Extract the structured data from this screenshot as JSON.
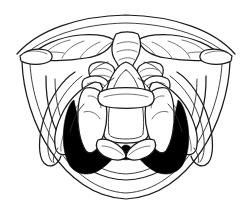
{
  "figure": {
    "kind": "line-drawing",
    "caption": "",
    "background_color": "#ffffff",
    "line_color": "#1a1a1a",
    "shadow_color": "#000000",
    "width": 251,
    "height": 224
  },
  "structures": {
    "tongue_base": {
      "label": "Base of tongue",
      "region": "superior arc"
    },
    "vallecula_left": {
      "label": "Left vallecula",
      "region": "upper left"
    },
    "vallecula_right": {
      "label": "Right vallecula",
      "region": "upper right"
    },
    "median_glossoepiglottic_fold": {
      "label": "Median glossoepiglottic fold",
      "region": "upper center"
    },
    "epiglottis": {
      "label": "Epiglottis",
      "region": "center"
    },
    "aryepiglottic_fold_left": {
      "label": "Left aryepiglottic fold",
      "region": "center left"
    },
    "aryepiglottic_fold_right": {
      "label": "Right aryepiglottic fold",
      "region": "center right"
    },
    "vestibular_fold_left": {
      "label": "Left vestibular fold",
      "region": "mid left"
    },
    "vestibular_fold_right": {
      "label": "Right vestibular fold",
      "region": "mid right"
    },
    "vocal_fold_left": {
      "label": "Left vocal fold",
      "region": "lower left"
    },
    "vocal_fold_right": {
      "label": "Right vocal fold",
      "region": "lower right"
    },
    "glottic_opening": {
      "label": "Glottic opening (rima glottidis)",
      "region": "lower center",
      "shading": "solid black"
    },
    "piriform_sinus_left": {
      "label": "Left piriform sinus",
      "region": "lateral left"
    },
    "piriform_sinus_right": {
      "label": "Right piriform sinus",
      "region": "lateral right"
    },
    "posterior_pharyngeal_wall": {
      "label": "Posterior pharyngeal wall",
      "region": "outer ring"
    },
    "arytenoid_left": {
      "label": "Left arytenoid cartilage",
      "region": "upper mid left"
    },
    "arytenoid_right": {
      "label": "Right arytenoid cartilage",
      "region": "upper mid right"
    }
  }
}
